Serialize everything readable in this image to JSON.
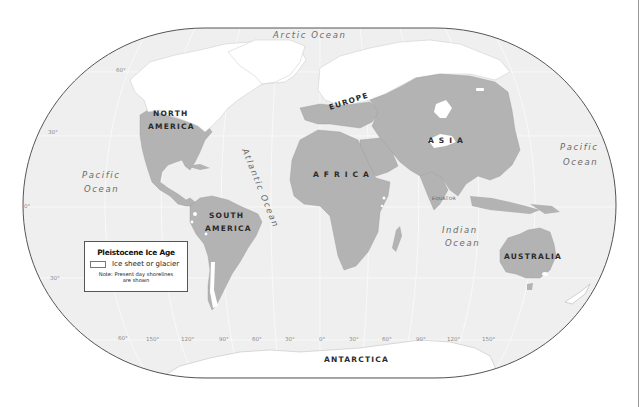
{
  "map": {
    "title": "Pleistocene Ice Age",
    "colors": {
      "ocean": "#efefef",
      "land": "#b3b3b3",
      "ice": "#ffffff",
      "outline": "#555555",
      "background": "#ffffff"
    },
    "continents": {
      "north_america_line1": "NORTH",
      "north_america_line2": "AMERICA",
      "south_america_line1": "SOUTH",
      "south_america_line2": "AMERICA",
      "europe": "EUROPE",
      "asia": "A S I A",
      "africa": "A F R I C A",
      "australia": "AUSTRALIA",
      "antarctica": "ANTARCTICA"
    },
    "oceans": {
      "arctic": "Arctic   Ocean",
      "pacific_west_line1": "Pacific",
      "pacific_west_line2": "Ocean",
      "pacific_east_line1": "Pacific",
      "pacific_east_line2": "Ocean",
      "atlantic": "Atlantic  Ocean",
      "indian_line1": "Indian",
      "indian_line2": "Ocean"
    },
    "equator_label": "EQUATOR",
    "latitude_labels": {
      "lat_60n": "60°",
      "lat_30n": "30°",
      "lat_0": "0°",
      "lat_30s": "30°",
      "lat_60s": "60°"
    },
    "longitude_labels": [
      "150°",
      "120°",
      "90°",
      "60°",
      "30°",
      "0°",
      "30°",
      "60°",
      "90°",
      "120°",
      "150°"
    ]
  },
  "legend": {
    "title": "Pleistocene Ice Age",
    "items": [
      {
        "swatch_color": "#ffffff",
        "label": "Ice sheet or glacier"
      }
    ],
    "note_line1": "Note: Present day shorelines",
    "note_line2": "are shown"
  }
}
